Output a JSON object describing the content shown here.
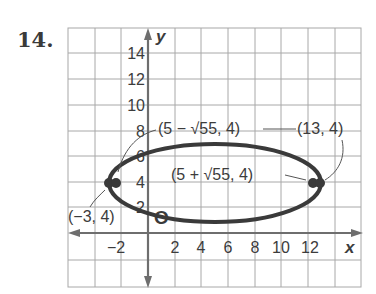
{
  "problem_number": "14.",
  "axes": {
    "x_label": "x",
    "y_label": "y",
    "x_ticks": [
      "−2",
      "2",
      "4",
      "6",
      "8",
      "10",
      "12"
    ],
    "y_ticks": [
      "2",
      "4",
      "6",
      "8",
      "10",
      "12",
      "14"
    ],
    "grid_step": 2,
    "x_range": [
      -4,
      18
    ],
    "y_range": [
      -4,
      16
    ]
  },
  "ellipse": {
    "center": [
      5,
      4
    ],
    "a": 8,
    "b": 3,
    "color": "#3a3a3a"
  },
  "points": {
    "vertex_left": {
      "label": "(−3, 4)",
      "x": -3,
      "y": 4
    },
    "vertex_right": {
      "label": "(13, 4)",
      "x": 13,
      "y": 4
    },
    "focus_left": {
      "label": "(5 − √55, 4)",
      "x": -2.416,
      "y": 4
    },
    "focus_right": {
      "label": "(5 + √55, 4)",
      "x": 12.416,
      "y": 4
    },
    "center_marker": {
      "label": "O",
      "x": 1,
      "y": 1
    }
  },
  "colors": {
    "grid": "#a8a8a8",
    "axis": "#6e6e6e",
    "curve": "#3a3a3a",
    "text": "#3c3c3c"
  }
}
